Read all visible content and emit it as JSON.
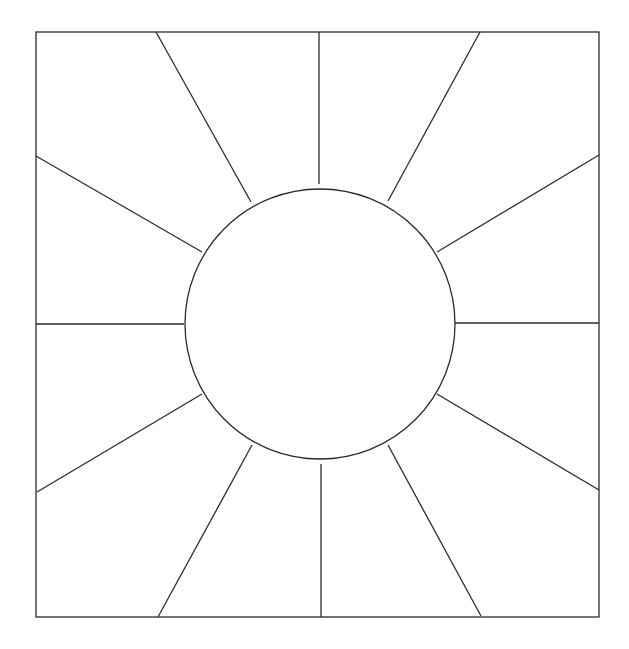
{
  "diagram": {
    "type": "sunburst-square-template",
    "colors": {
      "background": "#ffffff",
      "stroke": "#2b2b2b"
    },
    "frame": {
      "x1": 36,
      "y1": 32,
      "x2": 599,
      "y2": 617
    },
    "center_circle": {
      "cx": 320,
      "cy": 324,
      "r": 135
    },
    "rays": [
      {
        "name": "ray-top",
        "x1": 319,
        "y1": 184,
        "x2": 319,
        "y2": 32
      },
      {
        "name": "ray-top-left",
        "x1": 251,
        "y1": 202,
        "x2": 156,
        "y2": 32
      },
      {
        "name": "ray-top-right",
        "x1": 388,
        "y1": 201,
        "x2": 480,
        "y2": 32
      },
      {
        "name": "ray-left-upper",
        "x1": 202,
        "y1": 252,
        "x2": 36,
        "y2": 156
      },
      {
        "name": "ray-right-upper",
        "x1": 437,
        "y1": 252,
        "x2": 599,
        "y2": 155
      },
      {
        "name": "ray-left",
        "x1": 184,
        "y1": 324,
        "x2": 36,
        "y2": 324
      },
      {
        "name": "ray-right",
        "x1": 454,
        "y1": 323,
        "x2": 599,
        "y2": 323
      },
      {
        "name": "ray-left-lower",
        "x1": 202,
        "y1": 394,
        "x2": 37,
        "y2": 492
      },
      {
        "name": "ray-right-lower",
        "x1": 437,
        "y1": 394,
        "x2": 599,
        "y2": 490
      },
      {
        "name": "ray-bottom-left",
        "x1": 252,
        "y1": 445,
        "x2": 158,
        "y2": 617
      },
      {
        "name": "ray-bottom-right",
        "x1": 388,
        "y1": 445,
        "x2": 481,
        "y2": 616
      },
      {
        "name": "ray-bottom",
        "x1": 321,
        "y1": 464,
        "x2": 321,
        "y2": 617
      }
    ],
    "segment_count": 12
  }
}
